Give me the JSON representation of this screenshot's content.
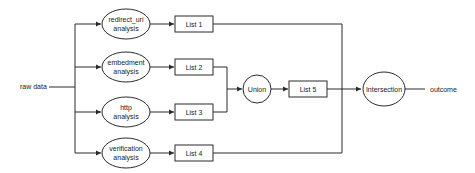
{
  "diagram": {
    "input_label": "raw data",
    "output_label": "outcome",
    "analyses": [
      {
        "line1": "redirect_uri",
        "line2": "analysis",
        "list": "List 1"
      },
      {
        "line1": "embedment",
        "line2": "analysis",
        "list": "List 2"
      },
      {
        "line1": "http",
        "line2": "analysis",
        "list": "List 3"
      },
      {
        "line1": "verification",
        "line2": "analysis",
        "list": "List 4"
      }
    ],
    "union_label": "Union",
    "union_list": "List 5",
    "intersection_label": "Intersection"
  }
}
